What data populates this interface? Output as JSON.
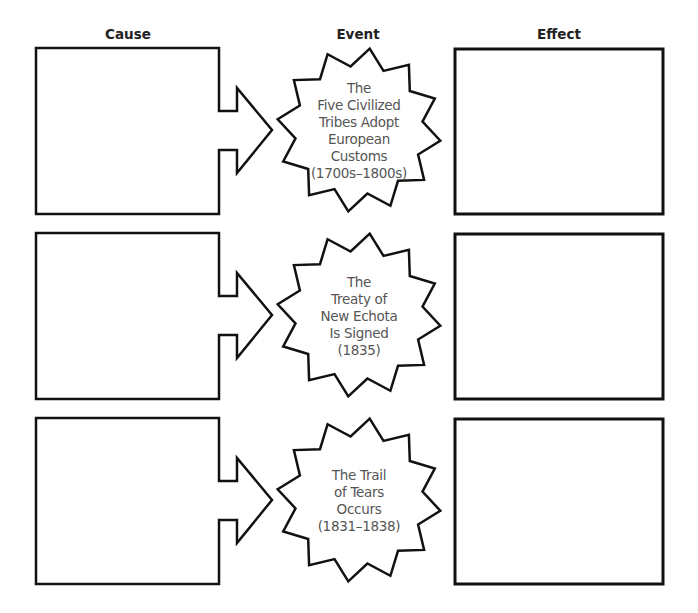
{
  "headers": {
    "cause": "Cause",
    "event": "Event",
    "effect": "Effect"
  },
  "rows": [
    {
      "cause": "",
      "event_lines": [
        "The",
        "Five Civilized",
        "Tribes Adopt",
        "European",
        "Customs",
        "(1700s–1800s)"
      ],
      "effect": ""
    },
    {
      "cause": "",
      "event_lines": [
        "The",
        "Treaty of",
        "New Echota",
        "Is Signed",
        "(1835)"
      ],
      "effect": ""
    },
    {
      "cause": "",
      "event_lines": [
        "The Trail",
        "of Tears",
        "Occurs",
        "(1831–1838)"
      ],
      "effect": ""
    }
  ],
  "colors": {
    "stroke": "#111111",
    "header_text": "#222222",
    "event_text": "#555555",
    "background": "#ffffff"
  }
}
